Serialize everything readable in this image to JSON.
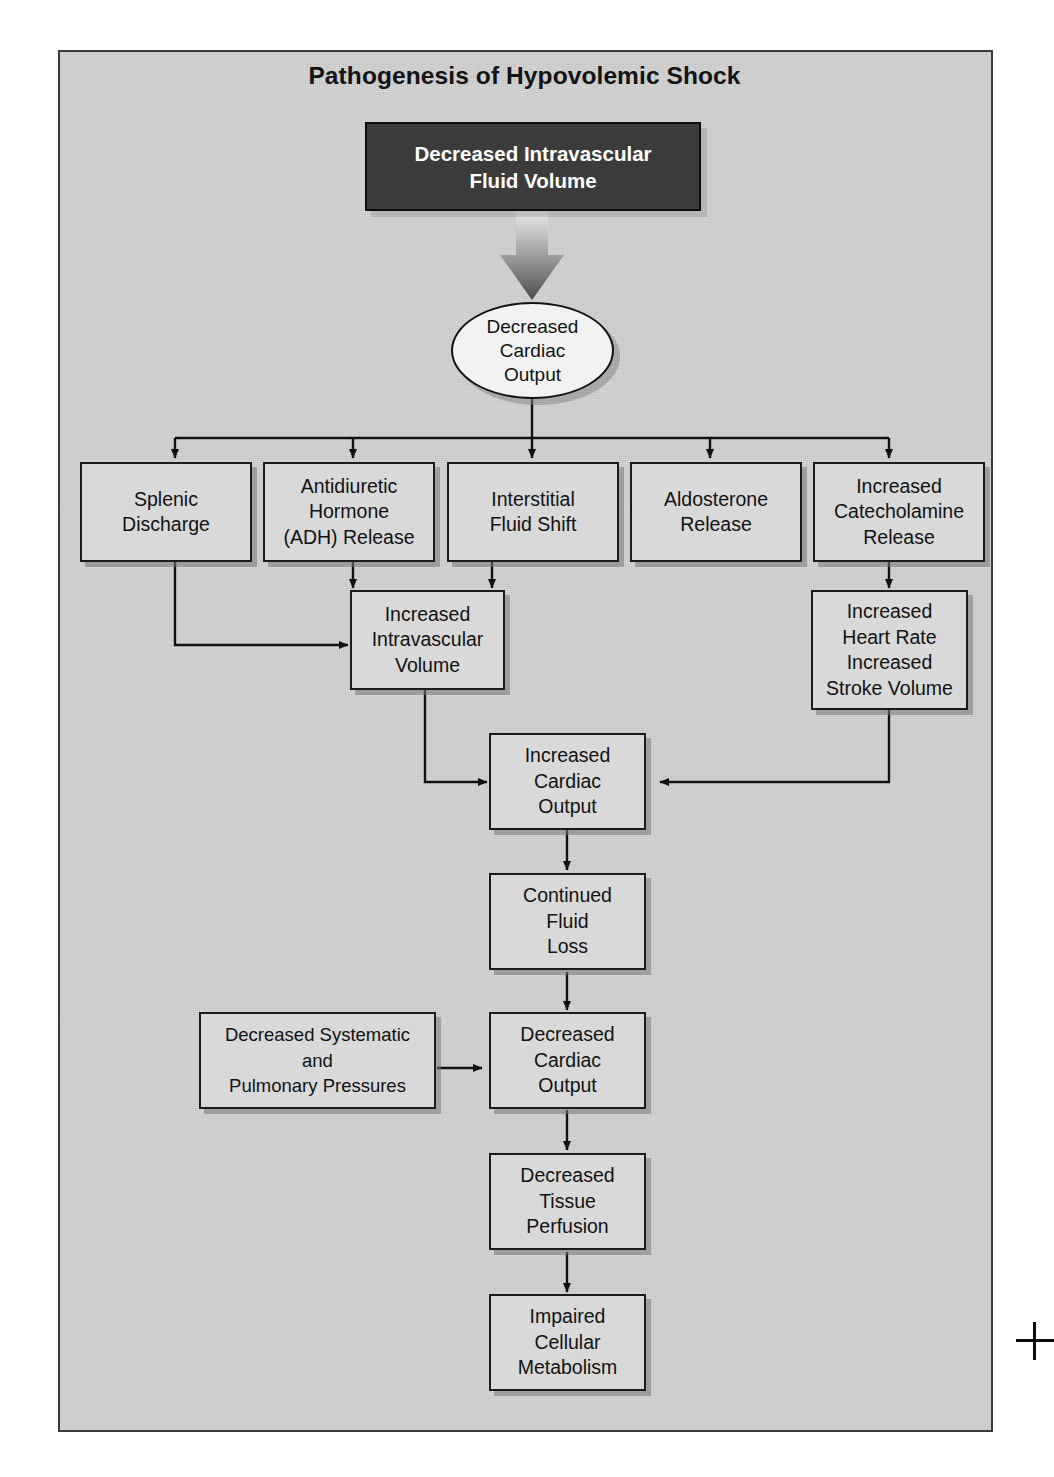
{
  "figure": {
    "title": "Pathogenesis of Hypovolemic Shock",
    "panel_background": "#cfcfcf",
    "node_fill": "#d9d9d9",
    "dark_node_fill": "#3b3b3b",
    "line_color": "#111111"
  },
  "nodes": {
    "root": "Decreased Intravascular\nFluid Volume",
    "root_line1": "Decreased Intravascular",
    "root_line2": "Fluid Volume",
    "decreased_cardiac_output_1": {
      "line1": "Decreased",
      "line2": "Cardiac",
      "line3": "Output"
    },
    "splenic_discharge": {
      "line1": "Splenic",
      "line2": "Discharge"
    },
    "adh_release": {
      "line1": "Antidiuretic",
      "line2": "Hormone",
      "line3": "(ADH) Release"
    },
    "interstitial_fluid_shift": {
      "line1": "Interstitial",
      "line2": "Fluid Shift"
    },
    "aldosterone_release": {
      "line1": "Aldosterone",
      "line2": "Release"
    },
    "catecholamine_release": {
      "line1": "Increased",
      "line2": "Catecholamine",
      "line3": "Release"
    },
    "increased_intravascular_volume": {
      "line1": "Increased",
      "line2": "Intravascular",
      "line3": "Volume"
    },
    "increased_heart_rate": {
      "line1": "Increased",
      "line2": "Heart Rate",
      "line3": "Increased",
      "line4": "Stroke Volume"
    },
    "increased_cardiac_output": {
      "line1": "Increased",
      "line2": "Cardiac",
      "line3": "Output"
    },
    "continued_fluid_loss": {
      "line1": "Continued",
      "line2": "Fluid",
      "line3": "Loss"
    },
    "decreased_pressures": {
      "line1": "Decreased Systematic",
      "line2": "and",
      "line3": "Pulmonary Pressures"
    },
    "decreased_cardiac_output_2": {
      "line1": "Decreased",
      "line2": "Cardiac",
      "line3": "Output"
    },
    "decreased_tissue_perfusion": {
      "line1": "Decreased",
      "line2": "Tissue",
      "line3": "Perfusion"
    },
    "impaired_cellular_metabolism": {
      "line1": "Impaired",
      "line2": "Cellular",
      "line3": "Metabolism"
    }
  },
  "flow": {
    "edges": [
      {
        "from": "root",
        "to": "decreased_cardiac_output_1",
        "style": "thick-gradient-arrow"
      },
      {
        "from": "decreased_cardiac_output_1",
        "to": "splenic_discharge",
        "style": "branch"
      },
      {
        "from": "decreased_cardiac_output_1",
        "to": "adh_release",
        "style": "branch"
      },
      {
        "from": "decreased_cardiac_output_1",
        "to": "interstitial_fluid_shift",
        "style": "branch"
      },
      {
        "from": "decreased_cardiac_output_1",
        "to": "aldosterone_release",
        "style": "branch"
      },
      {
        "from": "decreased_cardiac_output_1",
        "to": "catecholamine_release",
        "style": "branch"
      },
      {
        "from": "splenic_discharge",
        "to": "increased_intravascular_volume",
        "style": "elbow"
      },
      {
        "from": "adh_release",
        "to": "increased_intravascular_volume",
        "style": "straight"
      },
      {
        "from": "interstitial_fluid_shift",
        "to": "increased_intravascular_volume",
        "style": "straight"
      },
      {
        "from": "catecholamine_release",
        "to": "increased_heart_rate",
        "style": "straight"
      },
      {
        "from": "increased_intravascular_volume",
        "to": "increased_cardiac_output",
        "style": "elbow"
      },
      {
        "from": "increased_heart_rate",
        "to": "increased_cardiac_output",
        "style": "elbow"
      },
      {
        "from": "increased_cardiac_output",
        "to": "continued_fluid_loss",
        "style": "straight"
      },
      {
        "from": "continued_fluid_loss",
        "to": "decreased_cardiac_output_2",
        "style": "straight"
      },
      {
        "from": "decreased_pressures",
        "to": "decreased_cardiac_output_2",
        "style": "straight"
      },
      {
        "from": "decreased_cardiac_output_2",
        "to": "decreased_tissue_perfusion",
        "style": "straight"
      },
      {
        "from": "decreased_tissue_perfusion",
        "to": "impaired_cellular_metabolism",
        "style": "straight"
      }
    ]
  },
  "marks": {
    "crop_mark": "registration-crosshair"
  }
}
